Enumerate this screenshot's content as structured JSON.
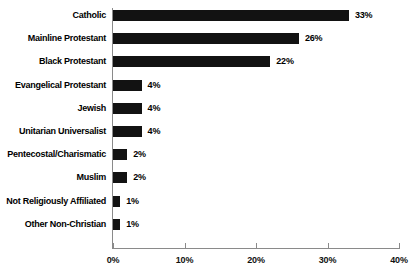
{
  "chart_data": {
    "type": "bar",
    "orientation": "horizontal",
    "title": "",
    "subtitle": "",
    "xlabel": "",
    "ylabel": "",
    "xlim": [
      0,
      40
    ],
    "xticks": [
      "0%",
      "10%",
      "20%",
      "30%",
      "40%"
    ],
    "xtick_values": [
      0,
      10,
      20,
      30,
      40
    ],
    "grid": false,
    "legend": false,
    "bar_color": "#121212",
    "axis_color": "#8a8a8a",
    "categories": [
      "Catholic",
      "Mainline Protestant",
      "Black Protestant",
      "Evangelical Protestant",
      "Jewish",
      "Unitarian Universalist",
      "Pentecostal/Charismatic",
      "Muslim",
      "Not Religiously Affiliated",
      "Other Non-Christian"
    ],
    "values": [
      33,
      26,
      22,
      4,
      4,
      4,
      2,
      2,
      1,
      1
    ],
    "value_labels": [
      "33%",
      "26%",
      "22%",
      "4%",
      "4%",
      "4%",
      "2%",
      "2%",
      "1%",
      "1%"
    ]
  }
}
